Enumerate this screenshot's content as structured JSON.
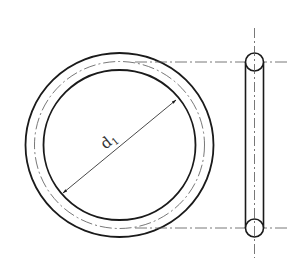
{
  "diagram": {
    "views": [
      "front-view",
      "side-view"
    ],
    "dimension_label": "d",
    "dimension_subscript": "1",
    "colors": {
      "line": "#1a1a1a",
      "centerline": "#555555",
      "background": "#ffffff"
    }
  }
}
